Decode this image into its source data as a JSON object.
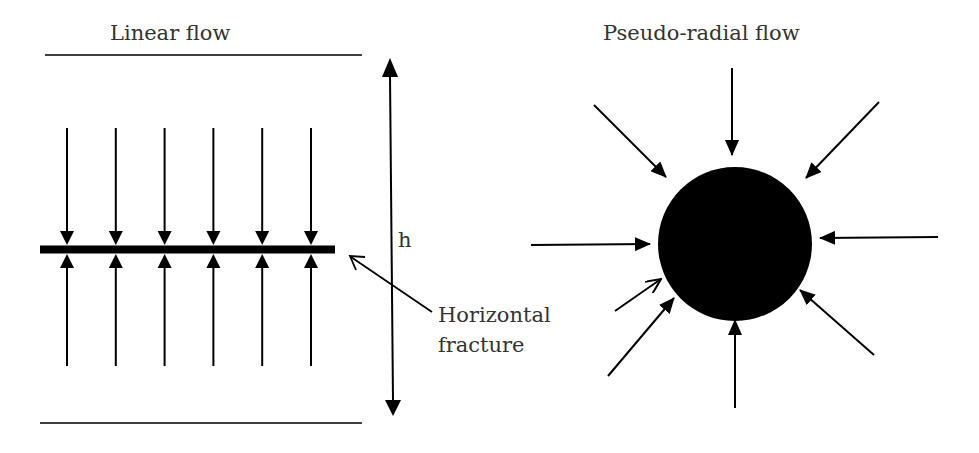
{
  "linear_panel": {
    "title": "Linear flow",
    "height_label": "h",
    "fracture_label_line1": "Horizontal",
    "fracture_label_line2": "fracture",
    "flow_arrow_pairs": 6
  },
  "radial_panel": {
    "title": "Pseudo-radial flow",
    "inflow_arrows": 8,
    "wellbore": "filled-circle"
  },
  "colors": {
    "ink": "#000000",
    "text": "#333333",
    "background": "#ffffff"
  }
}
